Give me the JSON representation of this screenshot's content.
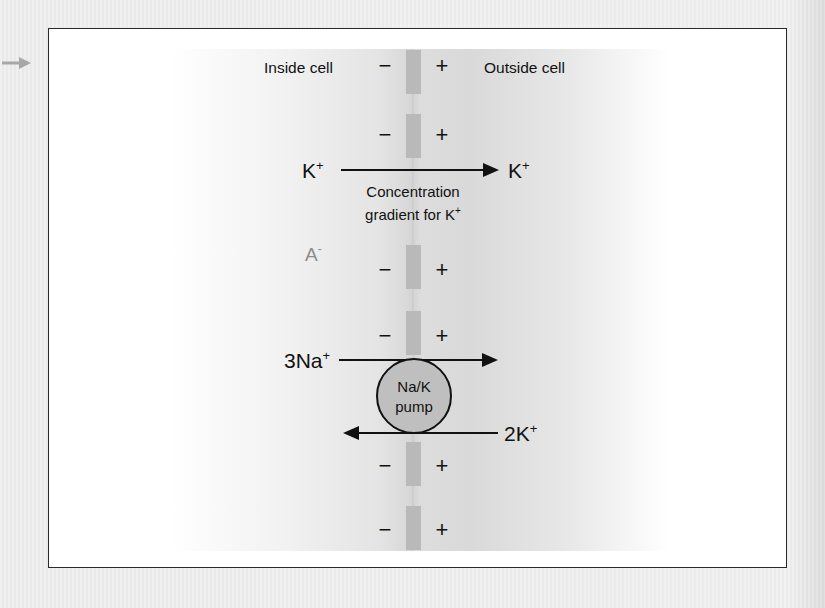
{
  "figure": {
    "header": {
      "inside_label": "Inside cell",
      "outside_label": "Outside cell"
    },
    "membrane": {
      "segments": 6,
      "inside_sign": "−",
      "outside_sign": "+",
      "color": "#b9b9b9"
    },
    "k_gradient": {
      "left_ion": "K",
      "right_ion": "K",
      "charge": "+",
      "caption_line1": "Concentration",
      "caption_line2": "gradient for K",
      "caption_charge": "+"
    },
    "anion": {
      "symbol": "A",
      "charge": "-",
      "color": "#8c8c8c"
    },
    "pump": {
      "label_line1": "Na/K",
      "label_line2": "pump",
      "fill": "#bfbfbf",
      "sodium_label": "3Na",
      "sodium_charge": "+",
      "potassium_label": "2K",
      "potassium_charge": "+"
    },
    "side_arrow": "arrow-right-icon"
  }
}
